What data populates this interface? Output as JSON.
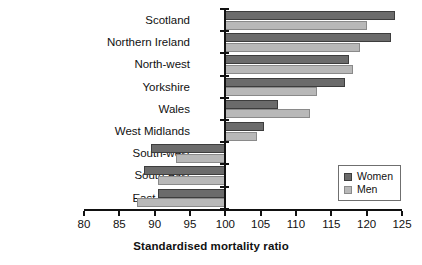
{
  "chart_data": {
    "type": "bar",
    "orientation": "horizontal",
    "title": "",
    "xlabel": "Standardised mortality ratio",
    "ylabel": "",
    "xlim": [
      80,
      125
    ],
    "xticks": [
      80,
      85,
      90,
      95,
      100,
      105,
      110,
      115,
      120,
      125
    ],
    "xtick_labels": [
      "80",
      "85",
      "90",
      "95",
      "100",
      "105",
      "110",
      "115",
      "120",
      "125"
    ],
    "baseline": 100,
    "grid": false,
    "legend_position": "lower-right",
    "categories": [
      "Scotland",
      "Northern Ireland",
      "North-west",
      "Yorkshire",
      "Wales",
      "West Midlands",
      "South-west",
      "South-east",
      "East Anglia"
    ],
    "series": [
      {
        "name": "Women",
        "color": "#6b6b6b",
        "values": [
          124,
          123.5,
          117.5,
          117,
          107.5,
          105.5,
          89.5,
          88.5,
          90.5
        ]
      },
      {
        "name": "Men",
        "color": "#b8b8b8",
        "values": [
          120,
          119,
          118,
          113,
          112,
          104.5,
          93,
          90.5,
          87.5
        ]
      }
    ]
  },
  "legend": {
    "items": [
      {
        "label": "Women",
        "swatch": "women"
      },
      {
        "label": "Men",
        "swatch": "men"
      }
    ]
  },
  "axis": {
    "x_title": "Standardised mortality ratio"
  }
}
